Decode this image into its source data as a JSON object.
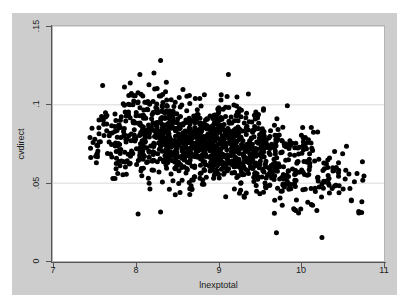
{
  "chart_data": {
    "type": "scatter",
    "title": "",
    "subtitle": "",
    "xlabel": "lnexptotal",
    "ylabel": "cvdirect",
    "xlim": [
      7,
      11
    ],
    "ylim": [
      0,
      0.15
    ],
    "xticks": [
      "7",
      "8",
      "9",
      "10",
      "11"
    ],
    "xtick_values": [
      7,
      8,
      9,
      10,
      11
    ],
    "yticks": [
      "0",
      ".05",
      ".1",
      ".15"
    ],
    "ytick_values": [
      0,
      0.05,
      0.1,
      0.15
    ],
    "grid": "horizontal",
    "legend": "none",
    "marker": {
      "shape": "circle",
      "color": "#000000",
      "size_px": 5,
      "count": 1300
    },
    "series": [
      {
        "name": "cvdirect",
        "n_points": 1300,
        "x_range_observed": [
          7.45,
          10.75
        ],
        "y_range_observed": [
          0.015,
          0.128
        ],
        "trend": "negative",
        "description": "Dense cloud of black dots declining from upper-left to lower-right; core concentration near lnexptotal 8.5-9.5 at cvdirect 0.06-0.09, thinning right tail descending toward cvdirect 0.035-0.05 near lnexptotal 10.5.",
        "density_profile": [
          {
            "x_center": 7.6,
            "n": 40,
            "y_mean": 0.079,
            "y_sd": 0.013
          },
          {
            "x_center": 7.9,
            "n": 95,
            "y_mean": 0.08,
            "y_sd": 0.014
          },
          {
            "x_center": 8.2,
            "n": 150,
            "y_mean": 0.08,
            "y_sd": 0.015
          },
          {
            "x_center": 8.5,
            "n": 190,
            "y_mean": 0.078,
            "y_sd": 0.014
          },
          {
            "x_center": 8.8,
            "n": 215,
            "y_mean": 0.076,
            "y_sd": 0.013
          },
          {
            "x_center": 9.1,
            "n": 205,
            "y_mean": 0.074,
            "y_sd": 0.013
          },
          {
            "x_center": 9.4,
            "n": 165,
            "y_mean": 0.071,
            "y_sd": 0.013
          },
          {
            "x_center": 9.7,
            "n": 110,
            "y_mean": 0.066,
            "y_sd": 0.013
          },
          {
            "x_center": 10.0,
            "n": 70,
            "y_mean": 0.06,
            "y_sd": 0.013
          },
          {
            "x_center": 10.3,
            "n": 38,
            "y_mean": 0.053,
            "y_sd": 0.012
          },
          {
            "x_center": 10.6,
            "n": 22,
            "y_mean": 0.048,
            "y_sd": 0.011
          }
        ],
        "notable_points": [
          {
            "x": 8.3,
            "y": 0.128,
            "note": "highest outlier"
          },
          {
            "x": 8.05,
            "y": 0.119,
            "note": "upper outlier"
          },
          {
            "x": 8.22,
            "y": 0.12,
            "note": "upper outlier"
          },
          {
            "x": 9.12,
            "y": 0.119,
            "note": "upper outlier"
          },
          {
            "x": 7.6,
            "y": 0.112,
            "note": "upper-left outlier"
          },
          {
            "x": 9.7,
            "y": 0.018,
            "note": "low outlier"
          },
          {
            "x": 10.25,
            "y": 0.015,
            "note": "low outlier"
          }
        ]
      }
    ]
  },
  "figure": {
    "background_color": "#ffffff",
    "graph_region_color": "#cdcdcd",
    "plot_area_color": "#ffffff",
    "gridline_color": "#d9d9d9",
    "axis_color": "#555555",
    "marker_color": "#000000"
  }
}
